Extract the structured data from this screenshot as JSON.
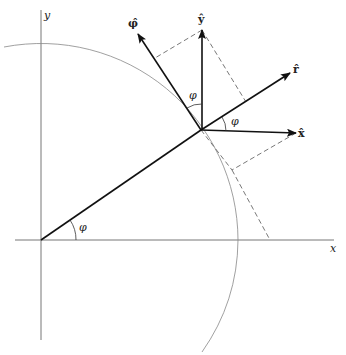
{
  "diagram": {
    "axes": {
      "x_label": "x",
      "y_label": "y"
    },
    "vectors": {
      "r_hat": "r̂",
      "phi_hat": "φ̂",
      "x_hat": "x̂",
      "y_hat": "ŷ"
    },
    "angles": {
      "at_origin": "φ",
      "between_y_and_phi": "φ",
      "between_x_and_r": "φ"
    },
    "colors": {
      "line": "#222222",
      "axis": "#777777",
      "circle": "#888888",
      "dashed": "#555555"
    }
  }
}
